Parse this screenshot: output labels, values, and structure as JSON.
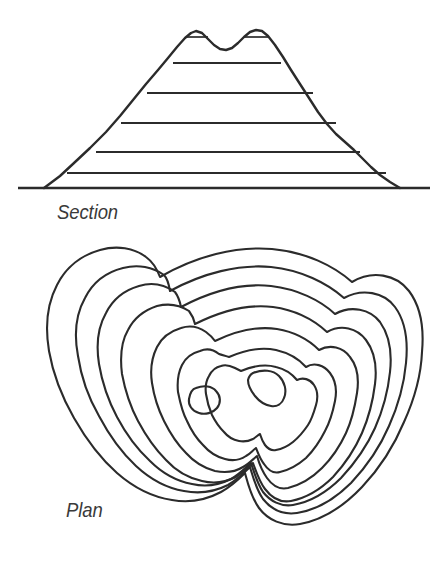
{
  "figure": {
    "background_color": "#ffffff",
    "line_color": "#2b2b2b",
    "label_color": "#3a3a3a"
  },
  "section_view": {
    "label": "Section",
    "icon_name": "hill-cross-section-icon",
    "description": "Cross-section of a hill with two summits, crossed by horizontal contour level lines",
    "ground_line": {
      "x1": 18,
      "y1": 188,
      "x2": 430,
      "y2": 188
    },
    "profile_points": "44,188 60,176 74,163 90,148 106,132 120,116 133,100 146,84 158,70 168,58 177,47 185,38 191,33 196,31 202,33 208,39 214,45 220,49 226,50 232,48 238,43 244,37 250,32 256,30 262,31 268,36 275,45 283,57 291,70 300,84 309,98 318,112 327,124 336,134 345,142 354,150 362,158 371,167 380,175 390,182 400,188",
    "level_lines": [
      {
        "name": "level-line-5",
        "y": 63,
        "x1": 173,
        "x2": 281
      },
      {
        "name": "level-line-4",
        "y": 93,
        "x1": 147,
        "x2": 313
      },
      {
        "name": "level-line-3",
        "y": 123,
        "x1": 121,
        "x2": 336
      },
      {
        "name": "level-line-2",
        "y": 152,
        "x1": 96,
        "x2": 360
      },
      {
        "name": "level-line-1",
        "y": 173,
        "x1": 67,
        "x2": 386
      }
    ],
    "summit_ticks": [
      {
        "name": "summit-tick-left",
        "y": 37,
        "x1": 186,
        "x2": 208
      },
      {
        "name": "summit-tick-right",
        "y": 37,
        "x1": 245,
        "x2": 268
      }
    ]
  },
  "plan_view": {
    "label": "Plan",
    "icon_name": "contour-map-icon",
    "description": "Plan view of the same hill showing seven nested contour rings and two small summit rings",
    "contour_count": 7,
    "summit_ring_count": 2,
    "contours": [
      {
        "name": "contour-ring-1-outermost",
        "level": 1,
        "d": "M 160,277 C 196,256 236,246 272,249 C 306,252 334,266 352,282 C 372,270 396,274 409,291 C 421,307 424,330 422,352 C 421,376 414,400 404,422 C 394,446 380,468 362,487 C 344,506 322,520 300,524 C 283,527 268,520 259,508 C 251,497 248,484 245,473 C 240,478 232,486 221,492 C 206,500 189,503 172,500 C 152,497 133,487 117,473 C 100,458 86,439 74,418 C 62,397 53,374 49,351 C 45,327 47,304 57,285 C 66,267 82,255 100,250 C 117,245 134,248 146,257 C 153,262 157,269 160,277 Z"
      },
      {
        "name": "contour-ring-2",
        "level": 2,
        "d": "M 170,291 C 203,273 239,264 271,267 C 301,270 327,283 344,298 C 362,288 384,292 395,307 C 406,322 408,343 406,363 C 404,385 398,406 389,426 C 380,447 367,466 351,483 C 335,499 316,510 297,513 C 283,515 271,509 263,499 C 256,489 253,477 250,467 C 245,472 238,479 228,485 C 214,492 199,494 184,491 C 166,488 150,479 136,466 C 121,452 109,435 99,416 C 88,397 81,376 78,356 C 74,335 76,314 85,298 C 93,282 107,272 123,268 C 138,264 153,267 164,275 C 168,279 169,285 170,291 Z"
      },
      {
        "name": "contour-ring-3",
        "level": 3,
        "d": "M 181,307 C 211,291 243,283 271,286 C 297,289 320,300 335,314 C 351,305 370,309 380,322 C 390,336 392,354 390,372 C 388,391 383,410 375,428 C 367,446 355,463 341,478 C 327,492 310,502 293,505 C 281,507 270,501 263,492 C 257,483 254,472 251,463 C 246,467 240,474 231,479 C 219,485 205,487 192,484 C 176,481 162,473 150,461 C 137,449 126,434 117,417 C 108,400 102,382 99,364 C 96,345 98,327 106,313 C 113,299 125,290 139,286 C 152,282 165,285 175,292 C 178,296 180,302 181,307 Z"
      },
      {
        "name": "contour-ring-4",
        "level": 4,
        "d": "M 195,324 C 221,311 249,304 273,307 C 295,310 314,320 327,332 C 341,324 357,328 366,340 C 375,352 377,368 375,384 C 373,400 369,417 362,433 C 355,449 345,464 333,477 C 321,489 306,498 291,501 C 280,503 271,497 265,489 C 259,481 256,471 253,463 C 249,467 243,472 236,477 C 226,482 214,484 202,481 C 188,478 176,471 166,460 C 155,449 146,436 138,421 C 130,406 125,390 122,374 C 120,358 121,342 128,330 C 134,318 145,310 157,306 C 169,303 180,305 189,311 C 192,315 194,319 195,324 Z"
      },
      {
        "name": "contour-ring-5",
        "level": 5,
        "d": "M 215,341 C 236,331 258,326 277,329 C 295,332 309,340 319,350 C 330,344 343,347 350,357 C 358,367 359,380 357,393 C 355,406 352,420 346,433 C 340,446 332,458 322,468 C 312,478 300,485 288,488 C 279,490 272,485 267,478 C 262,471 259,463 257,456 C 253,459 249,464 243,467 C 235,472 225,473 215,471 C 204,468 194,462 186,453 C 177,444 170,433 164,421 C 158,409 154,396 152,383 C 150,370 152,357 157,347 C 162,337 171,331 181,328 C 190,325 199,327 206,332 C 210,335 213,338 215,341 Z"
      },
      {
        "name": "contour-ring-6",
        "level": 6,
        "d": "M 229,357 C 245,350 262,347 276,350 C 289,353 299,359 306,367 C 314,362 324,365 330,373 C 336,381 337,391 335,401 C 333,411 330,422 325,431 C 320,441 314,450 306,458 C 298,465 289,470 280,472 C 273,474 268,470 264,464 C 260,459 258,453 256,448 C 253,450 250,454 246,456 C 240,460 232,461 225,459 C 217,457 209,452 203,445 C 196,438 191,430 187,421 C 182,412 180,402 178,392 C 177,382 178,373 182,365 C 186,357 192,353 200,351 C 207,348 214,350 219,354 C 222,355 226,356 229,357 Z"
      },
      {
        "name": "contour-ring-7-innermost",
        "level": 7,
        "d": "M 241,371 C 253,366 266,364 276,367 C 285,369 292,374 297,380 C 303,377 310,379 314,385 C 318,391 318,398 316,405 C 314,412 312,419 308,425 C 304,431 299,437 293,442 C 288,446 282,449 276,450 C 271,451 268,449 265,445 C 262,441 261,437 260,434 C 258,435 256,437 253,439 C 249,441 244,442 239,441 C 234,440 228,437 224,432 C 219,427 215,421 212,415 C 209,408 207,401 206,394 C 205,387 206,381 209,376 C 212,370 216,367 221,366 C 226,364 231,366 235,368 C 237,369 239,370 241,371 Z"
      }
    ],
    "summit_rings": [
      {
        "name": "summit-ring-left",
        "d": "M 196,388 C 204,385 212,386 216,391 C 221,396 221,403 217,408 C 213,413 205,415 199,413 C 192,411 188,405 189,399 C 190,393 192,389 196,388 Z"
      },
      {
        "name": "summit-ring-right",
        "d": "M 253,373 C 263,369 273,370 279,376 C 285,382 287,391 284,398 C 282,404 277,407 271,406 C 265,405 259,401 255,396 C 251,391 248,385 248,380 C 249,376 251,374 253,373 Z"
      }
    ]
  }
}
